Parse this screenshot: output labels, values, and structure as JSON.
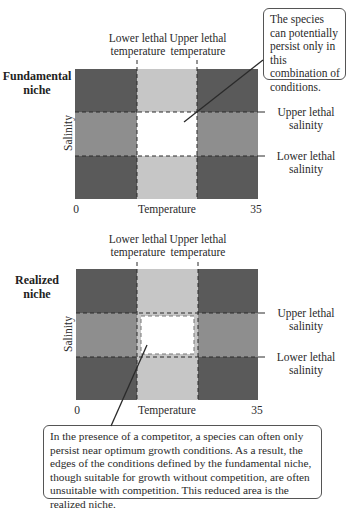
{
  "colors": {
    "dark": "#5a5a5a",
    "medium": "#8e8e8e",
    "light": "#c6c6c6",
    "optimal": "#ffffff",
    "line": "#2a2a2a"
  },
  "fundamental": {
    "title_line1": "Fundamental",
    "title_line2": "niche",
    "lower_temp_line1": "Lower lethal",
    "lower_temp_line2": "temperature",
    "upper_temp_line1": "Upper lethal",
    "upper_temp_line2": "temperature",
    "upper_salinity_line1": "Upper lethal",
    "upper_salinity_line2": "salinity",
    "lower_salinity_line1": "Lower lethal",
    "lower_salinity_line2": "salinity",
    "y_axis": "Salinity",
    "x_axis": "Temperature",
    "x_min": "0",
    "x_max": "35",
    "callout": "The species can potentially persist only in this combination of conditions."
  },
  "realized": {
    "title_line1": "Realized",
    "title_line2": "niche",
    "lower_temp_line1": "Lower lethal",
    "lower_temp_line2": "temperature",
    "upper_temp_line1": "Upper lethal",
    "upper_temp_line2": "temperature",
    "upper_salinity_line1": "Upper lethal",
    "upper_salinity_line2": "salinity",
    "lower_salinity_line1": "Lower lethal",
    "lower_salinity_line2": "salinity",
    "y_axis": "Salinity",
    "x_axis": "Temperature",
    "x_min": "0",
    "x_max": "35",
    "callout": "In the presence of a competitor, a species can often only persist near optimum growth conditions. As a result, the edges of the conditions defined by the fundamental niche, though suitable for growth without competition, are often unsuitable with competition. This reduced area is the realized niche."
  }
}
